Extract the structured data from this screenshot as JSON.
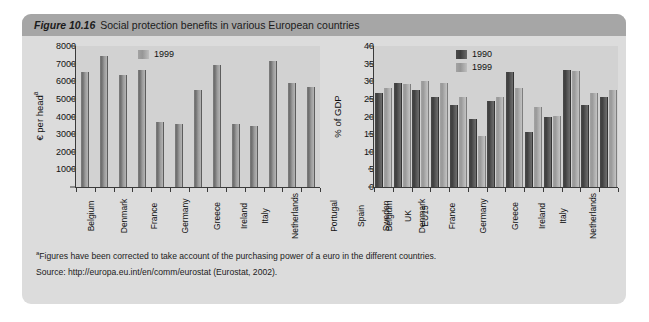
{
  "figure": {
    "number_label": "Figure 10.16",
    "title": "Social protection benefits in various European countries",
    "footnote_marker": "a",
    "footnote": "Figures have been corrected to take account of the purchasing power of a euro in the different countries.",
    "source": "Source: http://europa.eu.int/en/comm/eurostat (Eurostat, 2002)."
  },
  "chart_data": [
    {
      "id": "left",
      "type": "bar",
      "title": "",
      "xlabel": "",
      "ylabel": "€ per head",
      "ylabel_superscript": "a",
      "ylim": [
        0,
        8000
      ],
      "yticks": [
        0,
        1000,
        2000,
        3000,
        4000,
        5000,
        6000,
        7000,
        8000
      ],
      "ytick_labels": [
        "",
        "1000",
        "2000",
        "3000",
        "4000",
        "5000",
        "6000",
        "7000",
        "8000"
      ],
      "grid": false,
      "legend_position": "top-left-inside",
      "categories": [
        "Belgium",
        "Denmark",
        "France",
        "Germany",
        "Greece",
        "Ireland",
        "Italy",
        "Netherlands",
        "Portugal",
        "Spain",
        "Sweden",
        "UK",
        "EU15"
      ],
      "series": [
        {
          "name": "1999",
          "color": "#8b8b8b",
          "values": [
            6550,
            7430,
            6350,
            6650,
            3680,
            3550,
            5520,
            6930,
            3590,
            3460,
            7150,
            5890,
            5680
          ]
        }
      ]
    },
    {
      "id": "right",
      "type": "bar",
      "title": "",
      "xlabel": "",
      "ylabel": "% of GDP",
      "ylim": [
        0,
        40
      ],
      "yticks": [
        0,
        5,
        10,
        15,
        20,
        25,
        30,
        35,
        40
      ],
      "ytick_labels": [
        "0",
        "5",
        "10",
        "15",
        "20",
        "25",
        "30",
        "35",
        "40"
      ],
      "grid": false,
      "legend_position": "top-center-inside",
      "categories": [
        "Belgium",
        "Denmark",
        "France",
        "Germany",
        "Greece",
        "Ireland",
        "Italy",
        "Netherlands",
        "Portugal",
        "Spain",
        "Sweden",
        "UK",
        "EU15"
      ],
      "series": [
        {
          "name": "1990",
          "color": "#474747",
          "values": [
            26.7,
            29.4,
            27.5,
            25.5,
            23.3,
            19.4,
            24.4,
            32.5,
            15.5,
            20.0,
            33.2,
            23.4,
            25.5
          ]
        },
        {
          "name": "1999",
          "color": "#a8a8a8",
          "values": [
            28.0,
            29.3,
            30.2,
            29.4,
            25.5,
            14.6,
            25.4,
            28.2,
            22.8,
            20.1,
            32.8,
            26.7,
            27.5
          ]
        }
      ]
    }
  ]
}
